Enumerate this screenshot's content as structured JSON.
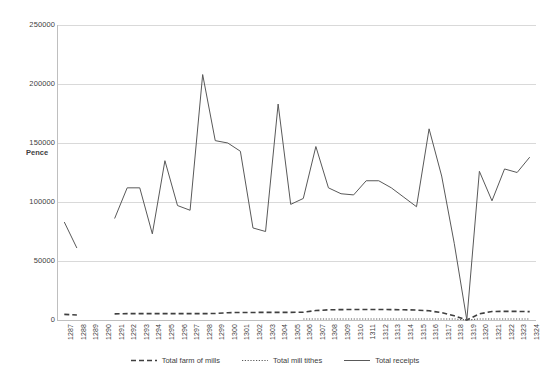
{
  "chart_data": {
    "type": "line",
    "title": "",
    "subtitle": "",
    "xlabel": "",
    "ylabel": "Pence",
    "ylim": [
      0,
      250000
    ],
    "ytick_labels": [
      "250000",
      "200000",
      "150000",
      "100000",
      "50000",
      "0"
    ],
    "ytick_values": [
      250000,
      200000,
      150000,
      100000,
      50000,
      0
    ],
    "grid": true,
    "legend_position": "bottom",
    "x": [
      1287,
      1288,
      1289,
      1290,
      1291,
      1292,
      1293,
      1294,
      1295,
      1296,
      1297,
      1298,
      1299,
      1300,
      1301,
      1302,
      1303,
      1304,
      1305,
      1306,
      1307,
      1308,
      1309,
      1310,
      1311,
      1312,
      1313,
      1314,
      1315,
      1316,
      1317,
      1318,
      1319,
      1320,
      1321,
      1322,
      1323,
      1324
    ],
    "tick_labels": [
      "1287",
      "1288",
      "1289",
      "1290",
      "1291",
      "1292",
      "1293",
      "1294",
      "1295",
      "1296",
      "1297",
      "1298",
      "1299",
      "1300",
      "1301",
      "1302",
      "1303",
      "1304",
      "1305",
      "1306",
      "1307",
      "1308",
      "1309",
      "1310",
      "1311",
      "1312",
      "1313",
      "1314",
      "1315",
      "1316",
      "1317",
      "1318",
      "1319",
      "1320",
      "1321",
      "1322",
      "1323",
      "1324"
    ],
    "series": [
      {
        "name": "Total farm of mills",
        "style": "dashed",
        "color": "#3f3f3f",
        "values": [
          4800,
          4200,
          null,
          null,
          5200,
          5400,
          5400,
          5400,
          5400,
          5400,
          5400,
          5400,
          5500,
          6200,
          6400,
          6400,
          6500,
          6500,
          6500,
          6600,
          8000,
          8600,
          8800,
          8900,
          8900,
          8900,
          8800,
          8700,
          8400,
          7800,
          6200,
          3600,
          0,
          5200,
          7200,
          7300,
          7300,
          7100
        ]
      },
      {
        "name": "Total mill tithes",
        "style": "dotted",
        "color": "#595959",
        "values": [
          null,
          null,
          null,
          null,
          null,
          null,
          null,
          null,
          null,
          null,
          null,
          null,
          null,
          null,
          null,
          null,
          null,
          null,
          null,
          900,
          900,
          900,
          900,
          900,
          900,
          900,
          900,
          900,
          900,
          900,
          900,
          900,
          0,
          900,
          900,
          900,
          900,
          900
        ]
      },
      {
        "name": "Total receipts",
        "style": "solid",
        "color": "#595959",
        "values": [
          83000,
          61000,
          null,
          null,
          86000,
          112000,
          112000,
          73000,
          135000,
          97000,
          93000,
          208000,
          152000,
          150000,
          143000,
          78000,
          75000,
          183000,
          98000,
          103000,
          147000,
          112000,
          107000,
          106000,
          118000,
          118000,
          112000,
          104000,
          96000,
          162000,
          122000,
          65000,
          0,
          126000,
          101000,
          128000,
          125000,
          138000
        ]
      }
    ]
  },
  "legend": {
    "items": [
      {
        "label": "Total farm of mills",
        "style": "dashed"
      },
      {
        "label": "Total mill tithes",
        "style": "dotted"
      },
      {
        "label": "Total receipts",
        "style": "solid"
      }
    ]
  }
}
